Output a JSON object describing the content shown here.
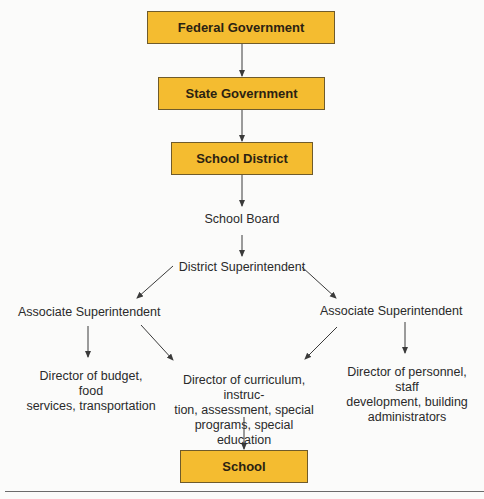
{
  "diagram": {
    "type": "org-chart",
    "nodes": {
      "federal": "Federal Government",
      "state": "State Government",
      "district": "School District",
      "board": "School Board",
      "superintendent": "District Superintendent",
      "assoc_left": "Associate Superintendent",
      "assoc_right": "Associate Superintendent",
      "dir_budget": "Director of budget, food\nservices, transportation",
      "dir_curriculum": "Director of curriculum, instruc-\ntion, assessment, special\nprograms, special education",
      "dir_personnel": "Director of personnel, staff\ndevelopment, building\nadministrators",
      "school": "School"
    },
    "edges": [
      {
        "from": "Federal Government",
        "to": "State Government"
      },
      {
        "from": "State Government",
        "to": "School District"
      },
      {
        "from": "School District",
        "to": "School Board"
      },
      {
        "from": "School Board",
        "to": "District Superintendent"
      },
      {
        "from": "District Superintendent",
        "to": "Associate Superintendent (left)"
      },
      {
        "from": "District Superintendent",
        "to": "Associate Superintendent (right)"
      },
      {
        "from": "Associate Superintendent (left)",
        "to": "Director of budget, food services, transportation"
      },
      {
        "from": "Associate Superintendent (left)",
        "to": "Director of curriculum, instruction, assessment, special programs, special education"
      },
      {
        "from": "Associate Superintendent (right)",
        "to": "Director of curriculum, instruction, assessment, special programs, special education"
      },
      {
        "from": "Associate Superintendent (right)",
        "to": "Director of personnel, staff development, building administrators"
      },
      {
        "from": "Director of curriculum, instruction, assessment, special programs, special education",
        "to": "School"
      }
    ],
    "colors": {
      "box_fill": "#f4bc30",
      "box_border": "#6f5b2b",
      "arrow": "#3a3a3a"
    }
  }
}
